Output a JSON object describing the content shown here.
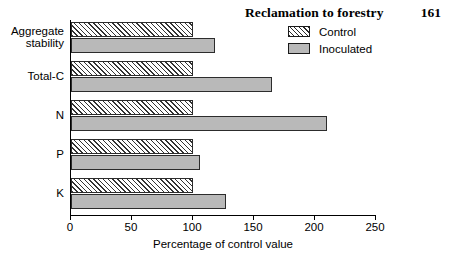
{
  "running_head": {
    "title": "Reclamation to forestry",
    "page_number": "161"
  },
  "legend": {
    "position": "top-right",
    "items": [
      {
        "label": "Control",
        "swatch": "hatched-diagonal",
        "color": "#ffffff"
      },
      {
        "label": "Inoculated",
        "swatch": "solid-gray",
        "color": "#b9b9b9"
      }
    ]
  },
  "chart_data": {
    "type": "bar",
    "orientation": "horizontal",
    "title": "",
    "xlabel": "Percentage of control value",
    "ylabel": "",
    "categories": [
      "Aggregate\nstability",
      "Total-C",
      "N",
      "P",
      "K"
    ],
    "series": [
      {
        "name": "Control",
        "values": [
          100,
          100,
          100,
          100,
          100
        ]
      },
      {
        "name": "Inoculated",
        "values": [
          118,
          165,
          210,
          106,
          127
        ]
      }
    ],
    "xlim": [
      0,
      250
    ],
    "xticks": [
      0,
      50,
      100,
      150,
      200,
      250
    ],
    "xtick_labels": [
      "0",
      "50",
      "100",
      "150",
      "200",
      "250"
    ],
    "grid": false
  }
}
